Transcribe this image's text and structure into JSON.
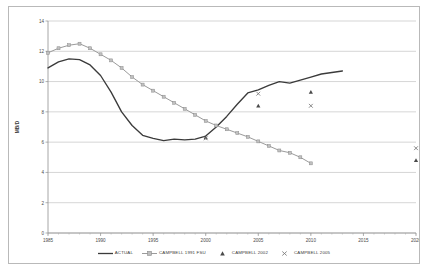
{
  "chart_data": {
    "type": "line",
    "title": "",
    "xlabel": "",
    "ylabel": "MB/D",
    "xlim": [
      1985,
      2020
    ],
    "ylim": [
      0,
      14
    ],
    "xticks": [
      1985,
      1990,
      1995,
      2000,
      2005,
      2010,
      2015,
      2020
    ],
    "yticks": [
      0,
      2,
      4,
      6,
      8,
      10,
      12,
      14
    ],
    "grid": "horizontal",
    "legend_position": "bottom",
    "series": [
      {
        "name": "ACTUAL",
        "style": "line",
        "color": "#3b3b3b",
        "x": [
          1985,
          1986,
          1987,
          1988,
          1989,
          1990,
          1991,
          1992,
          1993,
          1994,
          1995,
          1996,
          1997,
          1998,
          1999,
          2000,
          2001,
          2002,
          2003,
          2004,
          2005,
          2006,
          2007,
          2008,
          2009,
          2010,
          2011,
          2012,
          2013
        ],
        "values": [
          10.9,
          11.3,
          11.5,
          11.45,
          11.1,
          10.4,
          9.3,
          8.0,
          7.1,
          6.45,
          6.25,
          6.1,
          6.2,
          6.15,
          6.2,
          6.4,
          7.0,
          7.7,
          8.5,
          9.25,
          9.45,
          9.75,
          10.0,
          9.9,
          10.1,
          10.3,
          10.5,
          10.6,
          10.7
        ]
      },
      {
        "name": "CAMPBELL 1991 FSU",
        "style": "line-marker-square",
        "color": "#9b9b9b",
        "x": [
          1985,
          1986,
          1987,
          1988,
          1989,
          1990,
          1991,
          1992,
          1993,
          1994,
          1995,
          1996,
          1997,
          1998,
          1999,
          2000,
          2001,
          2002,
          2003,
          2004,
          2005,
          2006,
          2007,
          2008,
          2009,
          2010
        ],
        "values": [
          11.9,
          12.2,
          12.4,
          12.5,
          12.2,
          11.8,
          11.4,
          10.9,
          10.3,
          9.8,
          9.4,
          9.0,
          8.6,
          8.2,
          7.8,
          7.4,
          7.1,
          6.85,
          6.6,
          6.35,
          6.05,
          5.75,
          5.45,
          5.3,
          5.0,
          4.6
        ]
      },
      {
        "name": "CAMPBELL 2002",
        "style": "marker-triangle",
        "color": "#4a4a4a",
        "x": [
          2000,
          2005,
          2010,
          2020
        ],
        "values": [
          6.3,
          8.4,
          9.3,
          4.8
        ]
      },
      {
        "name": "CAMPBELL 2005",
        "style": "marker-x",
        "color": "#7d7d7d",
        "x": [
          2000,
          2005,
          2010,
          2020
        ],
        "values": [
          6.25,
          9.2,
          8.4,
          5.6
        ]
      }
    ]
  },
  "legend": {
    "items": [
      {
        "label": "ACTUAL",
        "key": "line-key"
      },
      {
        "label": "CAMPBELL 1991 FSU",
        "key": "line-square-key"
      },
      {
        "label": "CAMPBELL 2002",
        "key": "triangle-key"
      },
      {
        "label": "CAMPBELL 2005",
        "key": "x-key"
      }
    ]
  },
  "axes": {
    "y_title": "MB/D"
  }
}
